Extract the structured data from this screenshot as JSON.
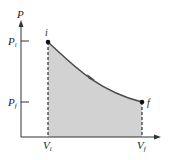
{
  "diagram": {
    "type": "PV diagram",
    "y_axis_label": "P",
    "x_axis_label": "V",
    "ticks": {
      "y": [
        {
          "label": "P",
          "sub": "i"
        },
        {
          "label": "P",
          "sub": "f"
        }
      ],
      "x": [
        {
          "label": "V",
          "sub": "i"
        },
        {
          "label": "V",
          "sub": "f"
        }
      ]
    },
    "points": [
      {
        "name": "i",
        "label": "i"
      },
      {
        "name": "f",
        "label": "f"
      }
    ],
    "colors": {
      "fill": "#cfcfcf",
      "curve": "#4a4a4a",
      "axis": "#333333",
      "point": "#111111"
    }
  }
}
